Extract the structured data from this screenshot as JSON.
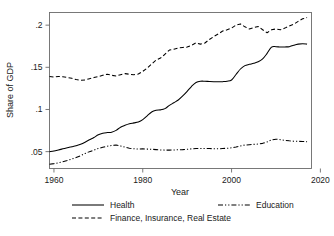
{
  "chart_data": {
    "type": "line",
    "title": "",
    "xlabel": "Year",
    "ylabel": "Share of GDP",
    "xlim": [
      1959,
      2018
    ],
    "ylim": [
      0.03,
      0.215
    ],
    "grid": false,
    "legend_position": "bottom",
    "xticks": [
      1960,
      1980,
      2000,
      2020
    ],
    "xticklabels": [
      "1960",
      "1980",
      "2000",
      "2020"
    ],
    "yticks": [
      0.05,
      0.1,
      0.15,
      0.2
    ],
    "yticklabels": [
      ".05",
      ".1",
      ".15",
      ".2"
    ],
    "x": [
      1959,
      1960,
      1961,
      1962,
      1963,
      1964,
      1965,
      1966,
      1967,
      1968,
      1969,
      1970,
      1971,
      1972,
      1973,
      1974,
      1975,
      1976,
      1977,
      1978,
      1979,
      1980,
      1981,
      1982,
      1983,
      1984,
      1985,
      1986,
      1987,
      1988,
      1989,
      1990,
      1991,
      1992,
      1993,
      1994,
      1995,
      1996,
      1997,
      1998,
      1999,
      2000,
      2001,
      2002,
      2003,
      2004,
      2005,
      2006,
      2007,
      2008,
      2009,
      2010,
      2011,
      2012,
      2013,
      2014,
      2015,
      2016,
      2017
    ],
    "series": [
      {
        "name": "Health",
        "style": "solid",
        "values": [
          0.05,
          0.0508,
          0.052,
          0.0533,
          0.0546,
          0.0558,
          0.057,
          0.0588,
          0.0612,
          0.064,
          0.0668,
          0.07,
          0.0718,
          0.0726,
          0.0731,
          0.0752,
          0.079,
          0.0812,
          0.083,
          0.0841,
          0.0852,
          0.088,
          0.0925,
          0.097,
          0.099,
          0.0995,
          0.101,
          0.1048,
          0.108,
          0.1112,
          0.116,
          0.1215,
          0.1275,
          0.132,
          0.1335,
          0.1335,
          0.1332,
          0.133,
          0.1328,
          0.133,
          0.1335,
          0.135,
          0.1415,
          0.148,
          0.152,
          0.1535,
          0.1548,
          0.1565,
          0.16,
          0.1665,
          0.174,
          0.1745,
          0.174,
          0.1742,
          0.1745,
          0.1762,
          0.1775,
          0.178,
          0.1775
        ]
      },
      {
        "name": "Education",
        "style": "dash-dot-dot",
        "values": [
          0.035,
          0.0358,
          0.0368,
          0.038,
          0.0395,
          0.0412,
          0.043,
          0.0452,
          0.0478,
          0.05,
          0.0518,
          0.0538,
          0.0552,
          0.0565,
          0.0572,
          0.0578,
          0.0568,
          0.0552,
          0.054,
          0.0534,
          0.0531,
          0.0533,
          0.053,
          0.0528,
          0.0524,
          0.052,
          0.0518,
          0.0518,
          0.052,
          0.0522,
          0.0524,
          0.0528,
          0.0533,
          0.0536,
          0.0538,
          0.0538,
          0.0536,
          0.0535,
          0.0534,
          0.0537,
          0.054,
          0.0545,
          0.0555,
          0.0568,
          0.0578,
          0.0582,
          0.0586,
          0.059,
          0.0598,
          0.0615,
          0.064,
          0.0648,
          0.0642,
          0.0634,
          0.0628,
          0.0624,
          0.0622,
          0.062,
          0.0618
        ]
      },
      {
        "name": "Finance, Insurance, Real Estate",
        "style": "dashed",
        "values": [
          0.139,
          0.1385,
          0.1392,
          0.1388,
          0.138,
          0.137,
          0.1355,
          0.1345,
          0.135,
          0.1365,
          0.1378,
          0.139,
          0.1405,
          0.1418,
          0.1405,
          0.1398,
          0.1412,
          0.1425,
          0.1418,
          0.1412,
          0.142,
          0.1452,
          0.149,
          0.154,
          0.1585,
          0.161,
          0.1655,
          0.1705,
          0.1715,
          0.173,
          0.1735,
          0.174,
          0.1762,
          0.179,
          0.1775,
          0.1788,
          0.183,
          0.1865,
          0.1895,
          0.193,
          0.1945,
          0.1965,
          0.2,
          0.2015,
          0.198,
          0.1955,
          0.197,
          0.1985,
          0.1945,
          0.191,
          0.1945,
          0.1955,
          0.1945,
          0.1965,
          0.199,
          0.201,
          0.2045,
          0.2075,
          0.209
        ]
      }
    ]
  },
  "legend": {
    "items": [
      {
        "label": "Health",
        "style": "solid"
      },
      {
        "label": "Education",
        "style": "dash-dot-dot"
      },
      {
        "label": "Finance, Insurance, Real Estate",
        "style": "dashed"
      }
    ]
  }
}
